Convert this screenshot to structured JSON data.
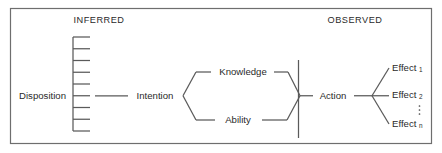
{
  "figure": {
    "kind": "conceptual-flow-diagram",
    "title_visible": false,
    "width": 442,
    "height": 153,
    "background_color": "#ffffff",
    "line_color": "#5a5a5a",
    "text_color": "#2a2a2a",
    "border_color": "#6e6e6e"
  },
  "headers": {
    "left": "INFERRED",
    "right": "OBSERVED"
  },
  "nodes": {
    "disposition": "Disposition",
    "intention": "Intention",
    "knowledge": "Knowledge",
    "ability": "Ability",
    "action": "Action",
    "effect_1_base": "Effect",
    "effect_1_sub": "1",
    "effect_2_base": "Effect",
    "effect_2_sub": "2",
    "effect_n_base": "Effect",
    "effect_n_sub": "n",
    "ellipsis": "⋮"
  },
  "flow_sequence": [
    "Disposition",
    "Intention",
    "Knowledge / Ability",
    "Action",
    "Effect1 / Effect2 / Effectn"
  ],
  "structure": {
    "disposition_bracket_ticks": 9,
    "divider_label": "inferred-observed-boundary",
    "branch_top": "Knowledge",
    "branch_bottom": "Ability",
    "effect_count_shown": 3
  }
}
